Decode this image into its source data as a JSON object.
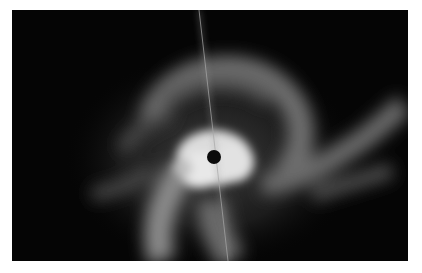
{
  "image": {
    "description": "Grayscale astronomical image of a nebula with a bright central region around an occulted star (black dot), swirling gaseous arms, and a thin diagonal diffraction/spike streak",
    "colors": {
      "border": "#ffffff",
      "background": "#050505",
      "core": "#e8e8e8",
      "nebula": "#8a8a8a",
      "occulting_dot": "#0a0a0a",
      "streak": "#9a9a9a"
    }
  }
}
